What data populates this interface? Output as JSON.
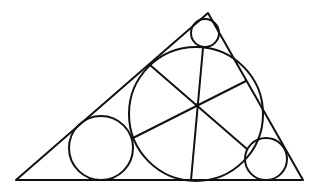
{
  "diagram": {
    "colors": {
      "background": "#ffffff",
      "stroke": "#111111"
    },
    "triangle": {
      "vertices": [
        [
          16,
          180
        ],
        [
          303,
          180
        ],
        [
          208,
          13
        ]
      ]
    },
    "circles": [
      {
        "name": "large-circle",
        "cx": 196,
        "cy": 114,
        "r": 67
      },
      {
        "name": "top-circle",
        "cx": 205,
        "cy": 33,
        "r": 14
      },
      {
        "name": "left-circle",
        "cx": 101,
        "cy": 148,
        "r": 32
      },
      {
        "name": "right-circle",
        "cx": 266,
        "cy": 159,
        "r": 21
      }
    ],
    "center_point": [
      197,
      105
    ],
    "spokes": [
      [
        [
          150,
          65
        ],
        [
          247,
          149
        ]
      ],
      [
        [
          203,
          48
        ],
        [
          191,
          180
        ]
      ],
      [
        [
          246,
          81
        ],
        [
          133,
          138
        ]
      ]
    ]
  }
}
